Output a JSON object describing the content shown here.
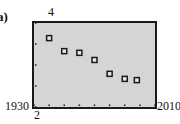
{
  "panel_label": "a)",
  "axes": {
    "y_max_label": "4",
    "y_min_label": "2",
    "x_min_label": "1930",
    "x_max_label": "2010"
  },
  "colors": {
    "plot_background": "#d5d5d5",
    "frame": "#1a1a1a",
    "marker_border": "#1a1a1a",
    "marker_fill": "#e8e8e8"
  },
  "chart_data": {
    "type": "scatter",
    "title": "",
    "panel": "a)",
    "xlabel": "",
    "ylabel": "",
    "xlim": [
      1930,
      2010
    ],
    "ylim": [
      2,
      4
    ],
    "x_tick_step": 10,
    "y_tick_step": 0.5,
    "grid": false,
    "legend": null,
    "marker": "hollow-square",
    "x": [
      1940,
      1950,
      1960,
      1970,
      1980,
      1990,
      1998
    ],
    "y": [
      3.64,
      3.33,
      3.29,
      3.12,
      2.79,
      2.67,
      2.64
    ]
  }
}
